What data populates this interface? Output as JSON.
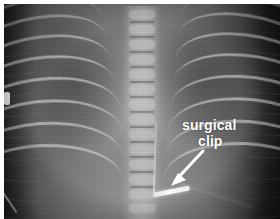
{
  "figure": {
    "kind": "radiograph",
    "modality": "x-ray",
    "view": "ventrodorsal thorax",
    "border_color": "#ffffff",
    "plate_tone_dark": "#1a1a1a",
    "plate_tone_mid": "#8a8a8a",
    "plate_tone_bright": "#ffffff"
  },
  "annotation": {
    "label_line1": "surgical",
    "label_line2": "clip",
    "label_color": "#ffffff",
    "arrow_color": "#ffffff",
    "arrow_direction": "down-left",
    "points_to": "surgical-clip"
  },
  "anatomy": {
    "spine_label": "vertebral column",
    "ribs_left_label": "left rib cage",
    "ribs_right_label": "right rib cage",
    "rib_pair_count": 9
  },
  "devices": {
    "clip_label": "surgical clip",
    "catheter_label": "radiopaque line",
    "edge_marker_label": "positioning marker"
  }
}
